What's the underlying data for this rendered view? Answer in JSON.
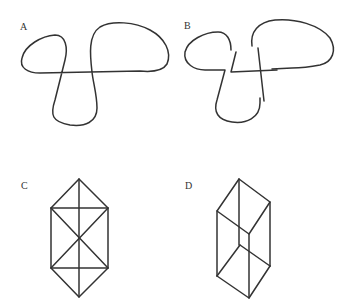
{
  "panels": [
    {
      "id": "A",
      "label": "A",
      "description": "Knot diagram drawn as a single closed curve with crossings shown flat"
    },
    {
      "id": "B",
      "label": "B",
      "description": "Same knot diagram with over/under crossing gaps"
    },
    {
      "id": "C",
      "label": "C",
      "description": "Hexagonal wireframe with diagonals and central vertical line"
    },
    {
      "id": "D",
      "label": "D",
      "description": "Wireframe rectangular prism (Necker-cube-like) in perspective"
    }
  ],
  "colors": {
    "stroke": "#333333",
    "background": "#ffffff"
  }
}
